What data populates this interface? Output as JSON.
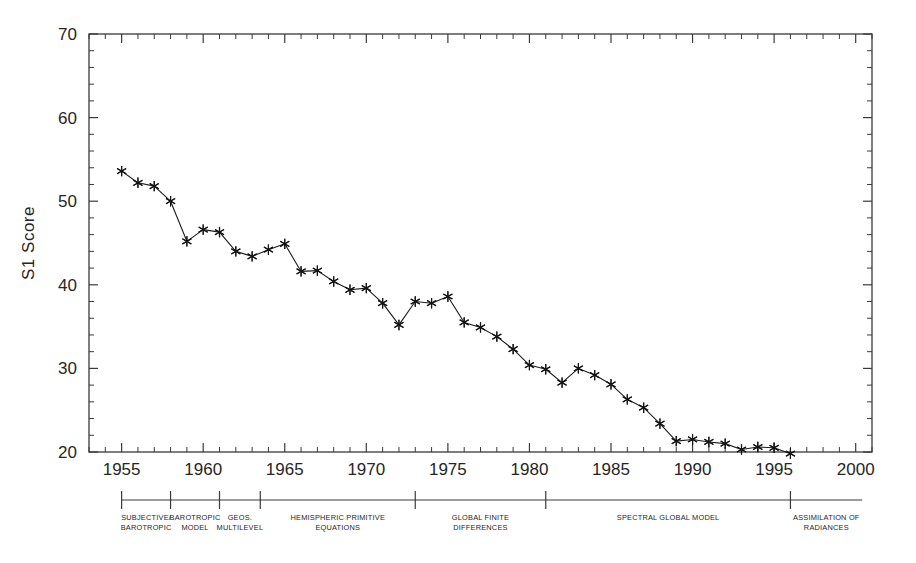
{
  "chart_data": {
    "type": "line",
    "title": "",
    "subtitle": "",
    "xlabel": "",
    "ylabel": "S1 Score",
    "xlim": [
      1953,
      2001
    ],
    "ylim": [
      20,
      70
    ],
    "grid": false,
    "legend": "none",
    "x_ticks_major": [
      1955,
      1960,
      1965,
      1970,
      1975,
      1980,
      1985,
      1990,
      1995,
      2000
    ],
    "x_tick_labels": [
      "1955",
      "1960",
      "1965",
      "1970",
      "1975",
      "1980",
      "1985",
      "1990",
      "1995",
      "2000"
    ],
    "x_tick_minor_step": 1,
    "y_ticks_major": [
      20,
      30,
      40,
      50,
      60,
      70
    ],
    "y_tick_labels": [
      "20",
      "30",
      "40",
      "50",
      "60",
      "70"
    ],
    "y_tick_minor_step": 2,
    "marker": "asterisk",
    "series": [
      {
        "name": "S1 Score",
        "x": [
          1955,
          1956,
          1957,
          1958,
          1959,
          1960,
          1961,
          1962,
          1963,
          1964,
          1965,
          1966,
          1967,
          1968,
          1969,
          1970,
          1971,
          1972,
          1973,
          1974,
          1975,
          1976,
          1977,
          1978,
          1979,
          1980,
          1981,
          1982,
          1983,
          1984,
          1985,
          1986,
          1987,
          1988,
          1989,
          1990,
          1991,
          1992,
          1993,
          1994,
          1995,
          1996
        ],
        "values": [
          53.6,
          52.2,
          51.8,
          50.0,
          45.2,
          46.6,
          46.3,
          44.0,
          43.4,
          44.2,
          44.9,
          41.6,
          41.7,
          40.4,
          39.4,
          39.6,
          37.8,
          35.2,
          38.0,
          37.8,
          38.6,
          35.5,
          34.9,
          33.8,
          32.3,
          30.4,
          29.9,
          28.3,
          30.0,
          29.2,
          28.1,
          26.3,
          25.3,
          23.4,
          21.3,
          21.5,
          21.2,
          21.0,
          20.3,
          20.6,
          20.5,
          19.8
        ]
      }
    ],
    "annotations": {
      "axis_caption": "Model eras",
      "eras": [
        {
          "label_line1": "SUBJECTIVE/",
          "label_line2": "BAROTROPIC",
          "start_year": 1955,
          "end_year": 1958
        },
        {
          "label_line1": "BAROTROPIC",
          "label_line2": "MODEL",
          "start_year": 1958,
          "end_year": 1961
        },
        {
          "label_line1": "GEOS.",
          "label_line2": "MULTILEVEL",
          "start_year": 1961,
          "end_year": 1963.5
        },
        {
          "label_line1": "HEMISPHERIC PRIMITIVE",
          "label_line2": "EQUATIONS",
          "start_year": 1963.5,
          "end_year": 1973
        },
        {
          "label_line1": "GLOBAL FINITE",
          "label_line2": "DIFFERENCES",
          "start_year": 1973,
          "end_year": 1981
        },
        {
          "label_line1": "SPECTRAL GLOBAL MODEL",
          "label_line2": "",
          "start_year": 1981,
          "end_year": 1996
        },
        {
          "label_line1": "ASSIMILATION OF",
          "label_line2": "RADIANCES",
          "start_year": 1996,
          "end_year": 2000.4
        }
      ]
    }
  },
  "colors": {
    "background": "#ffffff",
    "axis": "#3a3a3a",
    "line": "#1c1c1c",
    "text": "#262626"
  }
}
